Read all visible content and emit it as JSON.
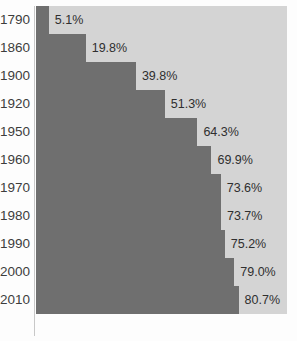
{
  "chart_data": {
    "type": "bar",
    "orientation": "horizontal",
    "title": "",
    "subtitle": "",
    "xlabel": "",
    "ylabel": "",
    "xlim": [
      0,
      100
    ],
    "grid": false,
    "legend": null,
    "axis_line": true,
    "categories": [
      "1790",
      "1860",
      "1900",
      "1920",
      "1950",
      "1960",
      "1970",
      "1980",
      "1990",
      "2000",
      "2010"
    ],
    "values": [
      5.1,
      19.8,
      39.8,
      51.3,
      64.3,
      69.9,
      73.6,
      73.7,
      75.2,
      79.0,
      80.7
    ],
    "value_labels": [
      "5.1%",
      "19.8%",
      "39.8%",
      "51.3%",
      "64.3%",
      "69.9%",
      "73.6%",
      "73.7%",
      "75.2%",
      "79.0%",
      "80.7%"
    ],
    "series": [
      {
        "name": "",
        "values": [
          5.1,
          19.8,
          39.8,
          51.3,
          64.3,
          69.9,
          73.6,
          73.7,
          75.2,
          79.0,
          80.7
        ]
      }
    ],
    "colors": {
      "bar_fill": "#6f6f6f",
      "bar_track": "#d4d4d4",
      "background": "#fdfdfd",
      "label_text": "#3d3d3d",
      "value_text": "#2f2f2f",
      "axis_line": "#c8c8c8"
    }
  }
}
